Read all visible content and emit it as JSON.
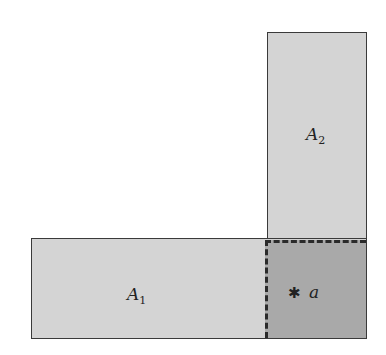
{
  "diagram": {
    "regions": [
      {
        "id": "A1",
        "label_base": "A",
        "label_sub": "1",
        "fill": "#d4d4d4"
      },
      {
        "id": "A2",
        "label_base": "A",
        "label_sub": "2",
        "fill": "#d4d4d4"
      },
      {
        "id": "intersection",
        "fill": "#a9a9a9",
        "border": "dashed"
      }
    ],
    "point": {
      "symbol": "✱",
      "label": "a"
    }
  }
}
